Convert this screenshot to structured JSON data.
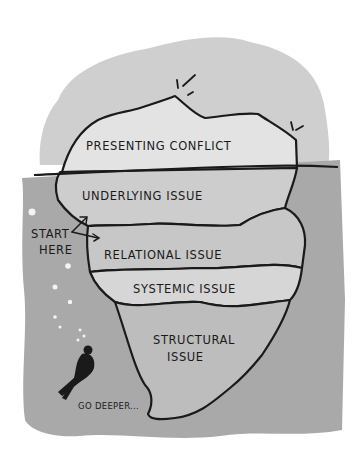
{
  "diagram": {
    "type": "iceberg",
    "layers": [
      {
        "label": "PRESENTING CONFLICT",
        "zone": "above-water"
      },
      {
        "label": "UNDERLYING ISSUE",
        "zone": "below-water"
      },
      {
        "label": "RELATIONAL ISSUE",
        "zone": "below-water"
      },
      {
        "label": "SYSTEMIC ISSUE",
        "zone": "below-water"
      },
      {
        "label": "STRUCTURAL",
        "label2": "ISSUE",
        "zone": "below-water"
      }
    ],
    "annotations": {
      "start_line1": "START",
      "start_line2": "HERE",
      "go_deeper": "GO DEEPER..."
    },
    "colors": {
      "sky": "#cfcfcf",
      "water": "#a9a9a9",
      "ice_light": "#e6e6e6",
      "ice_mid": "#c9c9c9",
      "ice_dark": "#9a9a9a",
      "ink": "#1a1a1a"
    }
  }
}
